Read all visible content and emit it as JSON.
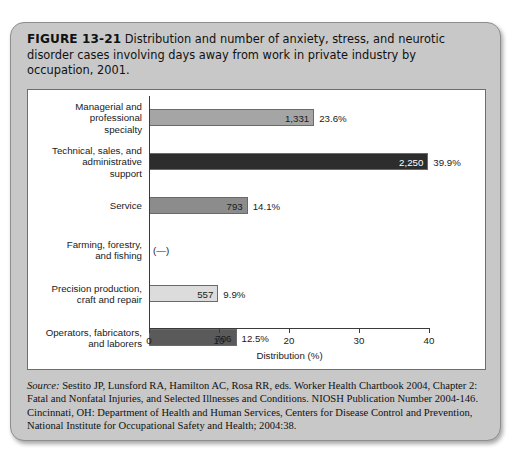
{
  "figure": {
    "number_label": "FIGURE 13-21",
    "caption": " Distribution and number of anxiety, stress, and neurotic disorder cases involving days away from work in private industry by occupation, 2001.",
    "source_label": "Source:",
    "source_text": " Sestito JP, Lunsford RA, Hamilton AC, Rosa RR, eds. Worker Health Chartbook 2004, Chapter 2: Fatal and Nonfatal Injuries, and Selected Illnesses and Conditions. NIOSH Publication Number 2004-146. Cincinnati, OH: Department of Health and Human Services, Centers for Disease Control and Prevention, National Institute for Occupational Safety and Health; 2004:38."
  },
  "colors": {
    "card_background": "#c8c8c8",
    "panel_background": "#ffffff",
    "axis": "#3a3a3a",
    "bar_border": "#6a6a6a"
  },
  "chart_data": {
    "type": "bar",
    "orientation": "horizontal",
    "title": "Distribution and number of anxiety, stress, and neurotic disorder cases involving days away from work in private industry by occupation, 2001.",
    "xlabel": "Distribution (%)",
    "ylabel": "",
    "xlim": [
      0,
      40
    ],
    "xticks": [
      0,
      10,
      20,
      30,
      40
    ],
    "xtick_labels": [
      "0",
      "10",
      "20",
      "30",
      "40"
    ],
    "grid": false,
    "legend": false,
    "value_label_note": "Each bar is labeled with case count inside the bar and percent of distribution outside the bar.",
    "categories": [
      "Managerial and professional specialty",
      "Technical, sales, and administrative support",
      "Service",
      "Farming, forestry, and fishing",
      "Precision production, craft and repair",
      "Operators, fabricators, and laborers"
    ],
    "values": [
      23.6,
      39.9,
      14.1,
      null,
      9.9,
      12.5
    ],
    "counts": [
      1331,
      2250,
      793,
      null,
      557,
      706
    ],
    "bars": [
      {
        "category_lines": [
          "Managerial and",
          "professional",
          "specialty"
        ],
        "count_label": "1,331",
        "percent_label": "23.6%",
        "value": 23.6,
        "fill": "#a5a5a5",
        "text_color": "#1a1a1a",
        "has_data": true
      },
      {
        "category_lines": [
          "Technical, sales, and",
          "administrative",
          "support"
        ],
        "count_label": "2,250",
        "percent_label": "39.9%",
        "value": 39.9,
        "fill": "#2d2d2d",
        "text_color": "#ffffff",
        "has_data": true
      },
      {
        "category_lines": [
          "Service"
        ],
        "count_label": "793",
        "percent_label": "14.1%",
        "value": 14.1,
        "fill": "#8c8c8c",
        "text_color": "#1a1a1a",
        "has_data": true
      },
      {
        "category_lines": [
          "Farming, forestry,",
          "and fishing"
        ],
        "count_label": "(—)",
        "percent_label": "",
        "value": null,
        "fill": "transparent",
        "text_color": "#1a1a1a",
        "has_data": false
      },
      {
        "category_lines": [
          "Precision production,",
          "craft and repair"
        ],
        "count_label": "557",
        "percent_label": "9.9%",
        "value": 9.9,
        "fill": "#dcdcdc",
        "text_color": "#1a1a1a",
        "has_data": true
      },
      {
        "category_lines": [
          "Operators, fabricators,",
          "and laborers"
        ],
        "count_label": "706",
        "percent_label": "12.5%",
        "value": 12.5,
        "fill": "#5a5a5a",
        "text_color": "#1a1a1a",
        "has_data": true
      }
    ]
  }
}
